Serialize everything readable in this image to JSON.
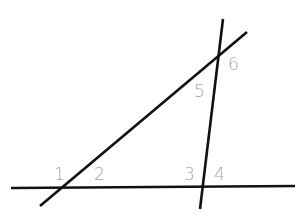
{
  "diagram": {
    "stroke_color": "#111111",
    "label_color": "#a8a8a8",
    "lines": [
      {
        "name": "horizontal-line",
        "x1": 11,
        "y1": 188,
        "x2": 295,
        "y2": 186
      },
      {
        "name": "diagonal-line",
        "x1": 40,
        "y1": 206,
        "x2": 247,
        "y2": 32
      },
      {
        "name": "steep-line",
        "x1": 223,
        "y1": 19,
        "x2": 200,
        "y2": 209
      }
    ],
    "labels": [
      {
        "text": "1",
        "x": 54,
        "y": 180
      },
      {
        "text": "2",
        "x": 94,
        "y": 180
      },
      {
        "text": "3",
        "x": 184,
        "y": 180
      },
      {
        "text": "4",
        "x": 214,
        "y": 180
      },
      {
        "text": "5",
        "x": 194,
        "y": 97
      },
      {
        "text": "6",
        "x": 228,
        "y": 70
      }
    ]
  }
}
